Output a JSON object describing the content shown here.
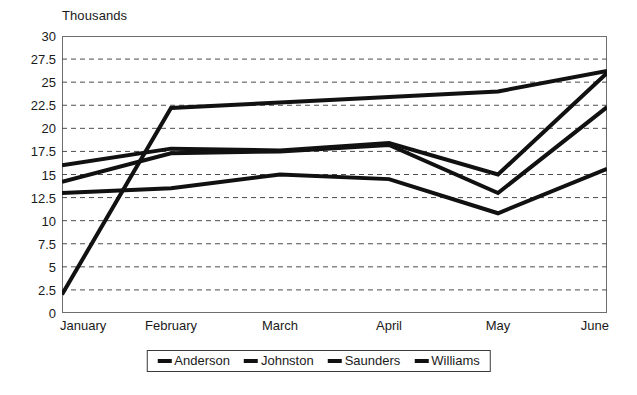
{
  "chart_data": {
    "type": "line",
    "title": "",
    "axis_unit_label": "Thousands",
    "xlabel": "",
    "ylabel": "",
    "categories": [
      "January",
      "February",
      "March",
      "April",
      "May",
      "June"
    ],
    "ylim": [
      0,
      30
    ],
    "ytick_step": 2.5,
    "ytick_labels": [
      "30",
      "27.5",
      "25",
      "22.5",
      "20",
      "17.5",
      "15",
      "12.5",
      "10",
      "7.5",
      "5",
      "2.5",
      "0"
    ],
    "ytick_values": [
      30,
      27.5,
      25,
      22.5,
      20,
      17.5,
      15,
      12.5,
      10,
      7.5,
      5,
      2.5,
      0
    ],
    "grid": true,
    "grid_style": "dashed-horizontal",
    "legend_position": "bottom",
    "series": [
      {
        "name": "Anderson",
        "values": [
          16.0,
          17.8,
          17.6,
          18.4,
          15.0,
          26.0
        ],
        "color": "#111111"
      },
      {
        "name": "Johnston",
        "values": [
          13.0,
          13.5,
          15.0,
          14.5,
          10.8,
          15.6
        ],
        "color": "#111111"
      },
      {
        "name": "Saunders",
        "values": [
          14.2,
          17.3,
          17.5,
          18.2,
          13.0,
          22.3
        ],
        "color": "#111111"
      },
      {
        "name": "Williams",
        "values": [
          2.0,
          22.2,
          22.8,
          23.4,
          24.0,
          26.2
        ],
        "color": "#111111"
      }
    ]
  },
  "legend": {
    "items": [
      {
        "label": "Anderson"
      },
      {
        "label": "Johnston"
      },
      {
        "label": "Saunders"
      },
      {
        "label": "Williams"
      }
    ]
  },
  "colors": {
    "line": "#111111",
    "frame": "#6e6e6e",
    "grid": "#4d4d4d",
    "text": "#1a1a1a"
  }
}
